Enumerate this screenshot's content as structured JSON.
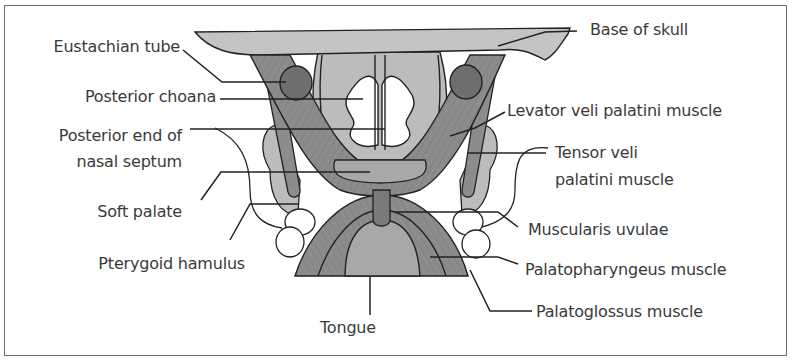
{
  "figure": {
    "colors": {
      "bone": "#c4c4c4",
      "muscle": "#8c8c8c",
      "muscle_dark": "#6e6e6e",
      "soft_tissue": "#bcbcbc",
      "mucosa_light": "#e4e4e4",
      "outline": "#222222",
      "text": "#3a3a3a",
      "frame": "#6a6a6a"
    }
  },
  "labels_left": [
    {
      "id": "eustachian-tube",
      "text": "Eustachian tube"
    },
    {
      "id": "posterior-choana",
      "text": "Posterior choana"
    },
    {
      "id": "posterior-end-nasal-septum-1",
      "text": "Posterior end of"
    },
    {
      "id": "posterior-end-nasal-septum-2",
      "text": "nasal septum"
    },
    {
      "id": "soft-palate",
      "text": "Soft palate"
    },
    {
      "id": "pterygoid-hamulus",
      "text": "Pterygoid hamulus"
    }
  ],
  "labels_right": [
    {
      "id": "base-of-skull",
      "text": "Base of skull"
    },
    {
      "id": "levator-veli-palatini",
      "text": "Levator veli palatini muscle"
    },
    {
      "id": "tensor-veli-palatini-1",
      "text": "Tensor veli"
    },
    {
      "id": "tensor-veli-palatini-2",
      "text": "palatini muscle"
    },
    {
      "id": "muscularis-uvulae",
      "text": "Muscularis uvulae"
    },
    {
      "id": "palatopharyngeus",
      "text": "Palatopharyngeus muscle"
    },
    {
      "id": "palatoglossus",
      "text": "Palatoglossus muscle"
    }
  ],
  "labels_bottom": [
    {
      "id": "tongue",
      "text": "Tongue"
    }
  ]
}
